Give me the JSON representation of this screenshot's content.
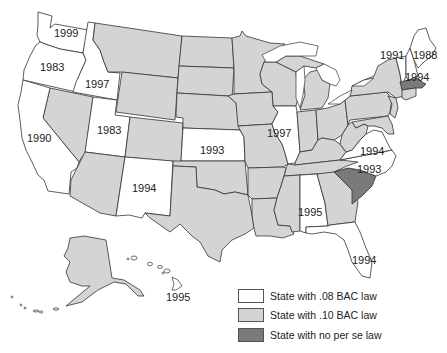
{
  "map": {
    "title": "",
    "colors": {
      "bac08": "#ffffff",
      "bac10": "#d4d4d4",
      "no_per_se": "#7a7a7a",
      "border": "#333333"
    },
    "labels": {
      "WA": "1999",
      "OR": "1983",
      "ID": "1997",
      "CA": "1990",
      "UT": "1983",
      "NM": "1994",
      "KS": "1993",
      "IL": "1997",
      "AL": "1995",
      "FL": "1994",
      "HI": "1995",
      "VA": "1994",
      "NC": "1993",
      "VT": "1991",
      "ME": "1988",
      "NH": "1994"
    },
    "states_08_bac": [
      "Washington",
      "Oregon",
      "Idaho",
      "California",
      "Utah",
      "New Mexico",
      "Kansas",
      "Illinois",
      "Alabama",
      "Florida",
      "Hawaii",
      "Virginia",
      "North Carolina",
      "Vermont",
      "Maine",
      "New Hampshire"
    ],
    "states_no_per_se": [
      "South Carolina",
      "Massachusetts"
    ]
  },
  "legend": {
    "items": [
      {
        "label": "State with .08 BAC law",
        "color": "#ffffff"
      },
      {
        "label": "State with .10 BAC law",
        "color": "#d4d4d4"
      },
      {
        "label": "State with no per se law",
        "color": "#7a7a7a"
      }
    ]
  }
}
